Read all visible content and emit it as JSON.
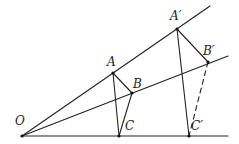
{
  "diagram": {
    "type": "geometric-construction",
    "points": [
      {
        "id": "O",
        "label": "O"
      },
      {
        "id": "A",
        "label": "A"
      },
      {
        "id": "B",
        "label": "B"
      },
      {
        "id": "C",
        "label": "C"
      },
      {
        "id": "A2",
        "label": "A′"
      },
      {
        "id": "B2",
        "label": "B′"
      },
      {
        "id": "C2",
        "label": "C′"
      }
    ],
    "rays": [
      {
        "from": "O",
        "through": [
          "A",
          "A2"
        ],
        "name": "ray-OA"
      },
      {
        "from": "O",
        "through": [
          "B",
          "B2"
        ],
        "name": "ray-OB"
      },
      {
        "from": "O",
        "through": [
          "C",
          "C2"
        ],
        "name": "ray-OC"
      }
    ],
    "segments": [
      {
        "from": "A",
        "to": "B",
        "style": "solid"
      },
      {
        "from": "B",
        "to": "C",
        "style": "solid"
      },
      {
        "from": "A",
        "to": "C",
        "style": "solid"
      },
      {
        "from": "A2",
        "to": "B2",
        "style": "solid"
      },
      {
        "from": "A2",
        "to": "C2",
        "style": "solid"
      },
      {
        "from": "B2",
        "to": "C2",
        "style": "dashed"
      }
    ]
  }
}
